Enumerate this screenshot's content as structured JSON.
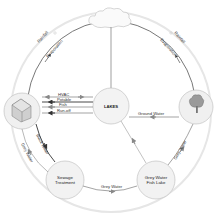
{
  "diagram": {
    "type": "water-cycle",
    "nodes": {
      "cloud": {
        "label": ""
      },
      "house": {
        "label": "",
        "icon": "house-icon"
      },
      "lakes": {
        "label": "LAKES"
      },
      "tree": {
        "label": "",
        "icon": "tree-icon"
      },
      "sewage": {
        "line1": "Sewage",
        "line2": "Treatment"
      },
      "fishlake": {
        "line1": "Grey Water",
        "line2": "Fish Lake"
      }
    },
    "edges": {
      "rainfall_left": "Rainfall",
      "evaporation_left": "Evaporation",
      "rainfall_right": "Rainfall",
      "evaporation_right": "Evaporation",
      "hvac": "HVAC",
      "potable": "Potable",
      "fish": "Fish",
      "runoff": "Run-off",
      "ground_water": "Ground Water",
      "black_water": "Black Water",
      "grey_water_left": "Grey Water",
      "grey_water_bottom": "Grey Water",
      "grey_water_right": "Grey Water"
    },
    "colors": {
      "line": "#555555",
      "node_fill": "#f2f2f2",
      "node_stroke": "#bbbbbb",
      "faint_ring": "#e4e4e4"
    }
  }
}
